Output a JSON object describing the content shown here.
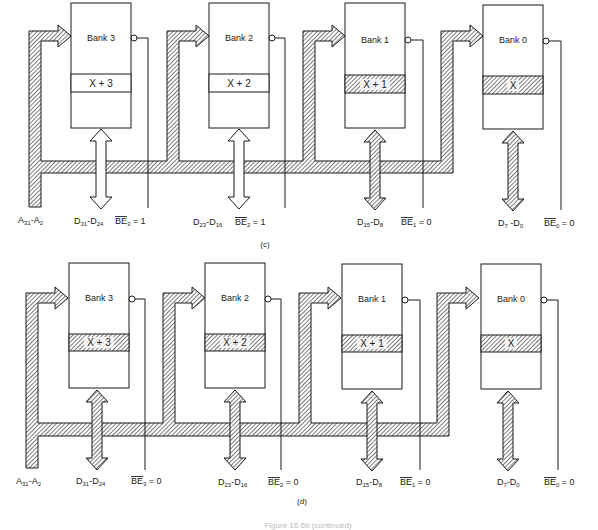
{
  "figure": {
    "caption_partial": "Figure 16.6b (continued)",
    "colors": {
      "line": "#1a1a1a",
      "hatch": "#444444",
      "background": "#ffffff"
    }
  },
  "panels": [
    {
      "id": "c",
      "label": "(c)",
      "address_bus_label": "A31-A2",
      "banks": [
        {
          "name": "Bank 3",
          "row": "X + 3",
          "selected": false,
          "data_label": "D31-D24",
          "be_label": "BE3 = 1",
          "be_value": "1"
        },
        {
          "name": "Bank 2",
          "row": "X + 2",
          "selected": false,
          "data_label": "D23-D16",
          "be_label": "BE2 = 1",
          "be_value": "1"
        },
        {
          "name": "Bank 1",
          "row": "X + 1",
          "selected": true,
          "data_label": "D15-D8",
          "be_label": "BE1 = 0",
          "be_value": "0"
        },
        {
          "name": "Bank 0",
          "row": "X",
          "selected": true,
          "data_label": "D7 -D0",
          "be_label": "BE0 = 0",
          "be_value": "0"
        }
      ]
    },
    {
      "id": "d",
      "label": "(d)",
      "address_bus_label": "A31-A2",
      "banks": [
        {
          "name": "Bank 3",
          "row": "X + 3",
          "selected": true,
          "data_label": "D31-D24",
          "be_label": "BE3 = 0",
          "be_value": "0"
        },
        {
          "name": "Bank 2",
          "row": "X + 2",
          "selected": true,
          "data_label": "D23-D16",
          "be_label": "BE2 = 0",
          "be_value": "0"
        },
        {
          "name": "Bank 1",
          "row": "X + 1",
          "selected": true,
          "data_label": "D15-D8",
          "be_label": "BE1 = 0",
          "be_value": "0"
        },
        {
          "name": "Bank 0",
          "row": "X",
          "selected": true,
          "data_label": "D7-D0",
          "be_label": "BE0 = 0",
          "be_value": "0"
        }
      ]
    }
  ],
  "text": {
    "c_bank3": "Bank 3",
    "c_bank2": "Bank 2",
    "c_bank1": "Bank 1",
    "c_bank0": "Bank 0",
    "c_row3": "X + 3",
    "c_row2": "X + 2",
    "c_row1": "X + 1",
    "c_row0": "X",
    "d_bank3": "Bank 3",
    "d_bank2": "Bank 2",
    "d_bank1": "Bank 1",
    "d_bank0": "Bank 0",
    "d_row3": "X + 3",
    "d_row2": "X + 2",
    "d_row1": "X + 1",
    "d_row0": "X",
    "addr_A": "A",
    "addr_31": "31",
    "addr_dash": "-A",
    "addr_2": "2",
    "d31": "31",
    "d24": "24",
    "d23": "23",
    "d16": "16",
    "d15": "15",
    "d8": "8",
    "d7": "7",
    "d0": "0",
    "D": "D",
    "dash_D": "-D",
    "dash_space_D": " -D",
    "BE": "BE",
    "s3": "3",
    "s2": "2",
    "s1": "1",
    "s0": "0",
    "eq1": " = 1",
    "eq0": " = 0",
    "label_c": "(c)",
    "label_d": "(d)",
    "caption": "Figure 16.6b (continued)"
  }
}
